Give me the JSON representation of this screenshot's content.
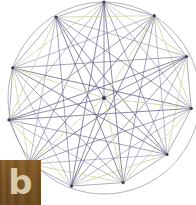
{
  "canvas": {
    "width": 196,
    "height": 205,
    "background": "#ffffff"
  },
  "watermark": {
    "name": "watermark-badge",
    "letter": "b",
    "background_color": "#7a5423",
    "letter_color": "#d8c9a8",
    "x": 0,
    "y": 160,
    "width": 41,
    "height": 45
  },
  "chart_data": {
    "type": "scatter",
    "title": "",
    "subtitle": "",
    "xlabel": "",
    "ylabel": "",
    "grid": false,
    "legend_position": "none",
    "xlim": [
      0,
      196
    ],
    "ylim": [
      0,
      205
    ],
    "colors": {
      "circle_outline": "#9a9aa8",
      "chord_primary": "#5a5a7e",
      "chord_secondary": "#7d7d9c",
      "chord_highlight": "#d9d8b0",
      "vertex_marker": "#3a3a60",
      "center_marker": "#3a3a60"
    },
    "circle": {
      "cx": 104,
      "cy": 98,
      "r": 96,
      "stroke": "#9a9aa8",
      "stroke_width": 0.9
    },
    "center_point": {
      "label": "O",
      "x": 104,
      "y": 98
    },
    "vertex_count": 11,
    "vertices": [
      {
        "label": "V1",
        "x": 104.0,
        "y": 2.0
      },
      {
        "label": "V2",
        "x": 154.3,
        "y": 15.7
      },
      {
        "label": "V3",
        "x": 186.6,
        "y": 56.5
      },
      {
        "label": "V4",
        "x": 191.2,
        "y": 108.4
      },
      {
        "label": "V5",
        "x": 167.0,
        "y": 154.5
      },
      {
        "label": "V6",
        "x": 123.1,
        "y": 182.6
      },
      {
        "label": "V7",
        "x": 71.4,
        "y": 186.1
      },
      {
        "label": "V8",
        "x": 29.2,
        "y": 164.0
      },
      {
        "label": "V9",
        "x": 9.0,
        "y": 119.9
      },
      {
        "label": "V10",
        "x": 12.7,
        "y": 67.9
      },
      {
        "label": "V11",
        "x": 56.0,
        "y": 17.1
      }
    ],
    "edges_note": "All 55 vertex pairs are connected; 11 additional radial spokes join each vertex to the center.",
    "radial_spoke_count": 11,
    "chord_count": 55
  }
}
